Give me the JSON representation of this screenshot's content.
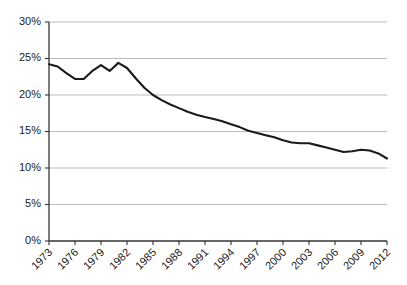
{
  "chart_data": {
    "type": "line",
    "title": "",
    "subtitle": "",
    "xlabel": "",
    "ylabel": "",
    "grid": true,
    "legend": false,
    "legend_position": "none",
    "xlim": [
      1973,
      2012
    ],
    "ylim": [
      0,
      30
    ],
    "ytick_labels": [
      "0%",
      "5%",
      "10%",
      "15%",
      "20%",
      "25%",
      "30%"
    ],
    "ytick_values": [
      0,
      5,
      10,
      15,
      20,
      25,
      30
    ],
    "xtick_labels": [
      "1973",
      "1976",
      "1979",
      "1982",
      "1985",
      "1988",
      "1991",
      "1994",
      "1997",
      "2000",
      "2003",
      "2006",
      "2009",
      "2012"
    ],
    "xtick_values": [
      1973,
      1976,
      1979,
      1982,
      1985,
      1988,
      1991,
      1994,
      1997,
      2000,
      2003,
      2006,
      2009,
      2012
    ],
    "x": [
      1973,
      1974,
      1975,
      1976,
      1977,
      1978,
      1979,
      1980,
      1981,
      1982,
      1983,
      1984,
      1985,
      1986,
      1987,
      1988,
      1989,
      1990,
      1991,
      1992,
      1993,
      1994,
      1995,
      1996,
      1997,
      1998,
      1999,
      2000,
      2001,
      2002,
      2003,
      2004,
      2005,
      2006,
      2007,
      2008,
      2009,
      2010,
      2011,
      2012
    ],
    "values": [
      24.2,
      23.9,
      23.0,
      22.2,
      22.2,
      23.3,
      24.1,
      23.3,
      24.4,
      23.7,
      22.3,
      21.0,
      20.0,
      19.3,
      18.7,
      18.2,
      17.7,
      17.3,
      17.0,
      16.7,
      16.4,
      16.0,
      15.6,
      15.1,
      14.8,
      14.5,
      14.2,
      13.8,
      13.5,
      13.4,
      13.4,
      13.1,
      12.8,
      12.5,
      12.2,
      12.3,
      12.5,
      12.4,
      12.0,
      11.3
    ],
    "series_name": "",
    "line_color": "#1a1a1a",
    "line_width": 2.1,
    "grid_color": "#b3b3b3",
    "axis_color": "#333333",
    "background": "#ffffff"
  },
  "layout": {
    "plot_left": 49,
    "plot_right": 387,
    "plot_top": 22,
    "plot_bottom": 241
  }
}
